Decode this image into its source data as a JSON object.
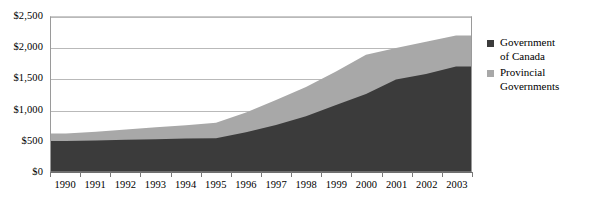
{
  "chart_data": {
    "type": "area",
    "stacked": true,
    "title": "",
    "subtitle": "",
    "xlabel": "",
    "ylabel": "",
    "categories": [
      "1990",
      "1991",
      "1992",
      "1993",
      "1994",
      "1995",
      "1996",
      "1997",
      "1998",
      "1999",
      "2000",
      "2001",
      "2002",
      "2003"
    ],
    "x": [
      1990,
      1991,
      1992,
      1993,
      1994,
      1995,
      1996,
      1997,
      1998,
      1999,
      2000,
      2001,
      2002,
      2003
    ],
    "ylim": [
      0,
      2500
    ],
    "ytick_values": [
      0,
      500,
      1000,
      1500,
      2000,
      2500
    ],
    "ytick_labels": [
      "$0",
      "$500",
      "$1,000",
      "$1,500",
      "$2,000",
      "$2,500"
    ],
    "grid": true,
    "legend_position": "right",
    "series": [
      {
        "name": "Government of Canada",
        "color": "#3b3b3b",
        "values": [
          500,
          510,
          520,
          530,
          540,
          545,
          640,
          760,
          900,
          1080,
          1260,
          1490,
          1580,
          1700
        ]
      },
      {
        "name": "Provincial Governments",
        "color": "#a8a8a8",
        "values": [
          120,
          140,
          165,
          190,
          215,
          250,
          320,
          400,
          470,
          540,
          630,
          510,
          520,
          500
        ]
      }
    ],
    "series_totals": [
      620,
      650,
      685,
      720,
      755,
      795,
      960,
      1160,
      1370,
      1620,
      1890,
      2000,
      2100,
      2200
    ]
  },
  "legend": {
    "items": [
      {
        "label": "Government\nof Canada",
        "color": "#3b3b3b",
        "swatch_name": "legend-swatch-government-of-canada"
      },
      {
        "label": "Provincial\nGovernments",
        "color": "#a8a8a8",
        "swatch_name": "legend-swatch-provincial-governments"
      }
    ]
  }
}
